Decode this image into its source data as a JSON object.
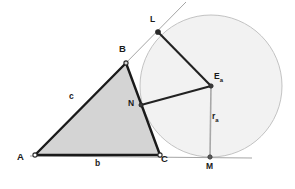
{
  "figure": {
    "background_color": "#ffffff",
    "width": 295,
    "height": 189
  },
  "styles": {
    "triangle_fill": "#d4d4d4",
    "triangle_stroke": "#1a1a1a",
    "circle_fill": "#f2f2f2",
    "circle_stroke": "#b8b8b8",
    "thin_line_color": "#9a9a9a",
    "radius_line_color": "#a0a0a0",
    "connector_color": "#222222",
    "point_fill": "#3a3a3a"
  },
  "points": {
    "A": {
      "label": "A",
      "x": 35,
      "y": 155,
      "label_x": 17,
      "label_y": 158
    },
    "B": {
      "label": "B",
      "x": 126,
      "y": 63,
      "label_x": 119,
      "label_y": 47
    },
    "C": {
      "label": "C",
      "x": 160,
      "y": 155,
      "label_x": 161,
      "label_y": 160
    },
    "L": {
      "label": "L",
      "x": 158,
      "y": 32,
      "label_x": 150,
      "label_y": 19
    },
    "N": {
      "label": "N",
      "x": 141,
      "y": 105,
      "label_x": 128,
      "label_y": 101
    },
    "M": {
      "label": "M",
      "x": 210,
      "y": 157,
      "label_x": 206,
      "label_y": 166
    },
    "Ea": {
      "label": "E",
      "sub": "a",
      "x": 211,
      "y": 86,
      "label_x": 214,
      "label_y": 76
    }
  },
  "circle": {
    "name": "excircle",
    "center_x": 211,
    "center_y": 86,
    "radius": 71
  },
  "segments": {
    "side_b": {
      "label": "b",
      "from": "A",
      "to": "C",
      "label_x": 95,
      "label_y": 163
    },
    "side_c": {
      "label": "c",
      "from": "A",
      "to": "B",
      "label_x": 69,
      "label_y": 96
    },
    "side_a": {
      "from": "B",
      "to": "C"
    },
    "radius_a": {
      "label": "r",
      "sub": "a",
      "from": "Ea",
      "to": "M",
      "label_x": 213,
      "label_y": 114
    },
    "radius_to_L": {
      "from": "Ea",
      "to": "L"
    },
    "radius_to_N": {
      "from": "Ea",
      "to": "N"
    }
  },
  "extended_lines": {
    "base_line": {
      "name": "line-AC-extended",
      "x1": 30,
      "y1": 156,
      "x2": 252,
      "y2": 158
    },
    "tangent_line": {
      "name": "line-AB-extended-through-L",
      "x1": 119,
      "y1": 70,
      "x2": 186,
      "y2": 2
    }
  },
  "labels_list": [
    "A",
    "B",
    "C",
    "L",
    "N",
    "M",
    "E",
    "r",
    "b",
    "c"
  ]
}
